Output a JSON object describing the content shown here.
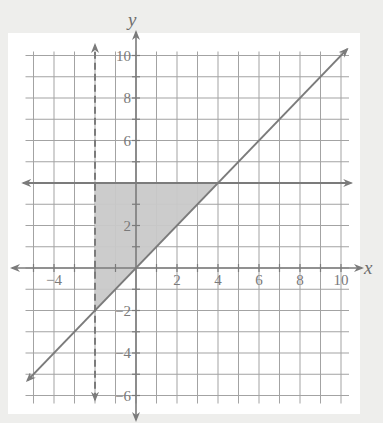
{
  "chart_data": {
    "type": "line",
    "title": "",
    "xlabel": "x",
    "ylabel": "y",
    "xlim": [
      -5,
      10
    ],
    "ylim": [
      -6,
      10
    ],
    "grid": true,
    "grid_step": 1,
    "x_tick_labels": [
      {
        "value": -4,
        "label": "−4"
      },
      {
        "value": 2,
        "label": "2"
      },
      {
        "value": 4,
        "label": "4"
      },
      {
        "value": 6,
        "label": "6"
      },
      {
        "value": 8,
        "label": "8"
      },
      {
        "value": 10,
        "label": "10"
      }
    ],
    "y_tick_labels": [
      {
        "value": 10,
        "label": "10"
      },
      {
        "value": 8,
        "label": "8"
      },
      {
        "value": 6,
        "label": "6"
      },
      {
        "value": 2,
        "label": "2"
      },
      {
        "value": -2,
        "label": "−2"
      },
      {
        "value": -4,
        "label": "−4"
      },
      {
        "value": -6,
        "label": "−6"
      }
    ],
    "series": [
      {
        "name": "y = x",
        "kind": "solid",
        "equation": "y = x",
        "points": [
          [
            -5.3,
            -5.3
          ],
          [
            10.3,
            10.3
          ]
        ],
        "arrows": "both"
      },
      {
        "name": "y = 4",
        "kind": "solid",
        "equation": "y = 4",
        "points": [
          [
            -5.5,
            4
          ],
          [
            10.5,
            4
          ]
        ],
        "arrows": "both"
      },
      {
        "name": "x = -2",
        "kind": "dashed",
        "equation": "x = -2",
        "points": [
          [
            -2,
            -6.2
          ],
          [
            -2,
            10.5
          ]
        ],
        "arrows": "both"
      }
    ],
    "shaded_region": {
      "description": "Feasible region of the system x > -2, y <= 4, y >= x",
      "vertices": [
        [
          -2,
          -2
        ],
        [
          -2,
          4
        ],
        [
          4,
          4
        ]
      ],
      "fill": "#c9c9c9"
    },
    "legend": null
  },
  "colors": {
    "background": "#eeeeec",
    "panel": "#ffffff",
    "grid": "#a3a3a3",
    "line": "#7b7b7b",
    "shade": "#c9c9c9"
  }
}
